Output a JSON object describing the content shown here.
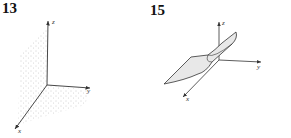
{
  "figures": [
    {
      "number": "13",
      "description": "Dotted plane region in 3D coordinate system",
      "axes": {
        "x": "x",
        "y": "y",
        "z": "z"
      }
    },
    {
      "number": "15",
      "description": "Curved surface patch in 3D coordinate system",
      "axes": {
        "x": "x",
        "y": "y",
        "z": "z"
      }
    }
  ],
  "colors": {
    "ink": "#333333",
    "stipple": "#9a9a9a",
    "surface_fill": "#e4e4e4"
  }
}
